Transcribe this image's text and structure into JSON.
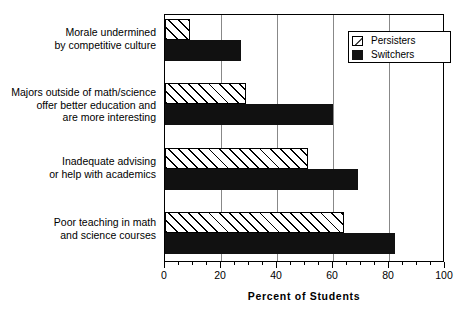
{
  "chart_data": {
    "type": "bar",
    "orientation": "horizontal",
    "title": "",
    "xlabel": "Percent of Students",
    "ylabel": "",
    "xlim": [
      0,
      100
    ],
    "xticks": [
      0,
      20,
      40,
      60,
      80,
      100
    ],
    "xtick_labels": [
      "0",
      "20",
      "40",
      "60",
      "80",
      "100"
    ],
    "minor_tick_interval": 5,
    "grid": "vertical gridlines at 20, 40, 60, 80",
    "legend_position": "top-right inside plot",
    "categories": [
      "Morale undermined by competitive culture",
      "Majors outside of math/science offer better education and are more interesting",
      "Inadequate advising or help with academics",
      "Poor teaching in math and science courses"
    ],
    "series": [
      {
        "name": "Persisters",
        "values": [
          9,
          29,
          51,
          64
        ],
        "fill": "diagonal-hatch"
      },
      {
        "name": "Switchers",
        "values": [
          27,
          60,
          69,
          82
        ],
        "fill": "solid-black"
      }
    ]
  },
  "categories": [
    {
      "lines": [
        "Morale undermined",
        "by competitive culture"
      ]
    },
    {
      "lines": [
        "Majors outside of math/science",
        "offer better education and",
        "are more interesting"
      ]
    },
    {
      "lines": [
        "Inadequate advising",
        "or help with academics"
      ]
    },
    {
      "lines": [
        "Poor teaching in math",
        "and science courses"
      ]
    }
  ],
  "legend": {
    "entries": [
      {
        "label": "Persisters"
      },
      {
        "label": "Switchers"
      }
    ]
  },
  "axis": {
    "title": "Percent of Students",
    "tick_labels": [
      "0",
      "20",
      "40",
      "60",
      "80",
      "100"
    ]
  },
  "colors": {
    "bar_switchers": "#111111",
    "bar_persisters_fill": "#ffffff",
    "hatch": "#000000",
    "frame": "#000000",
    "gridline": "#888888"
  }
}
